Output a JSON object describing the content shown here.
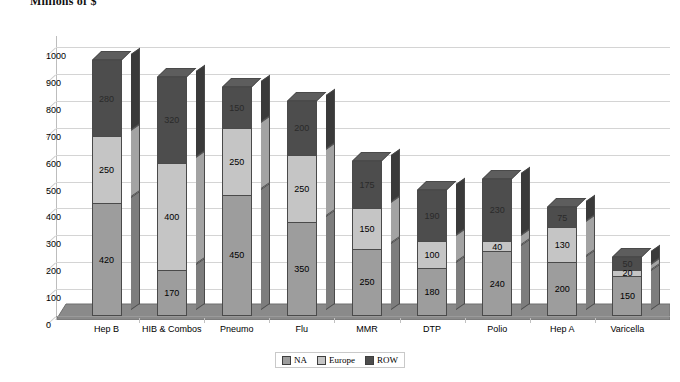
{
  "chart_data": {
    "type": "bar",
    "subtype": "stacked-3d-column",
    "title": "Millions of $",
    "xlabel": "",
    "ylabel": "",
    "ylim": [
      0,
      1000
    ],
    "ytick_step": 100,
    "yticks": [
      0,
      100,
      200,
      300,
      400,
      500,
      600,
      700,
      800,
      900,
      1000
    ],
    "grid": true,
    "legend_position": "bottom-center",
    "categories": [
      "Hep B",
      "HIB & Combos",
      "Pneumo",
      "Flu",
      "MMR",
      "DTP",
      "Polio",
      "Hep A",
      "Varicella"
    ],
    "series": [
      {
        "name": "NA",
        "color": "#9d9d9d",
        "values": [
          420,
          170,
          450,
          350,
          250,
          180,
          240,
          200,
          150
        ]
      },
      {
        "name": "Europe",
        "color": "#c5c5c5",
        "values": [
          250,
          400,
          250,
          250,
          150,
          100,
          40,
          130,
          20
        ]
      },
      {
        "name": "ROW",
        "color": "#4d4d4d",
        "values": [
          280,
          320,
          150,
          200,
          175,
          190,
          230,
          75,
          50
        ]
      }
    ],
    "totals": [
      950,
      890,
      850,
      800,
      575,
      470,
      510,
      405,
      220
    ]
  },
  "legend": {
    "items": [
      {
        "label": "NA",
        "swatch": "#9d9d9d"
      },
      {
        "label": "Europe",
        "swatch": "#c5c5c5"
      },
      {
        "label": "ROW",
        "swatch": "#4d4d4d"
      }
    ]
  },
  "colors": {
    "background": "#ffffff",
    "gridline": "#d4d4d4",
    "axis": "#bdbdbd",
    "floor": "#8a8a8a",
    "outline": "#4a4a4a"
  }
}
